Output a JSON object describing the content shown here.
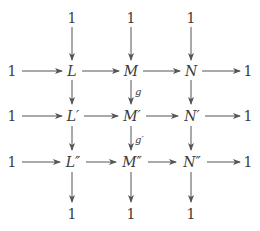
{
  "diagram": {
    "type": "commutative-diagram",
    "nodes": {
      "top": [
        "1",
        "1",
        "1"
      ],
      "row1": [
        "1",
        "L",
        "M",
        "N",
        "1"
      ],
      "row2": [
        "1",
        "L′",
        "M′",
        "N′",
        "1"
      ],
      "row3": [
        "1",
        "L″",
        "M″",
        "N″",
        "1"
      ],
      "bottom": [
        "1",
        "1",
        "1"
      ]
    },
    "labels": {
      "g": "g",
      "g_prime": "g′"
    },
    "colors": {
      "ink": "#3a3a3a",
      "arrow": "#555555"
    }
  }
}
